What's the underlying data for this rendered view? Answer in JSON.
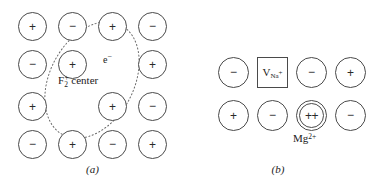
{
  "figure": {
    "panels": [
      {
        "id": "a",
        "caption": "(a)",
        "type": "F2-plus-center-lattice",
        "annotations": {
          "electron": "e",
          "electron_superscript": "−",
          "center_label_main": "F",
          "center_label_sub": "2",
          "center_label_sup": "+",
          "center_label_text": " center"
        },
        "grid": {
          "rows": 4,
          "cols": 4,
          "cells": [
            [
              {
                "kind": "ion",
                "sign": "+"
              },
              {
                "kind": "ion",
                "sign": "−"
              },
              {
                "kind": "ion",
                "sign": "+"
              },
              {
                "kind": "ion",
                "sign": "−"
              }
            ],
            [
              {
                "kind": "ion",
                "sign": "−"
              },
              {
                "kind": "ion",
                "sign": "+"
              },
              {
                "kind": "vacancy",
                "sign": ""
              },
              {
                "kind": "ion",
                "sign": "+"
              }
            ],
            [
              {
                "kind": "ion",
                "sign": "+"
              },
              {
                "kind": "vacancy",
                "sign": ""
              },
              {
                "kind": "ion",
                "sign": "+"
              },
              {
                "kind": "ion",
                "sign": "−"
              }
            ],
            [
              {
                "kind": "ion",
                "sign": "−"
              },
              {
                "kind": "ion",
                "sign": "+"
              },
              {
                "kind": "ion",
                "sign": "−"
              },
              {
                "kind": "ion",
                "sign": "+"
              }
            ]
          ]
        },
        "ellipse": {
          "style": "dotted",
          "color": "#6b6b6b",
          "cx": 92,
          "cy": 80,
          "rx": 62,
          "ry": 42,
          "rotation_deg": -62
        }
      },
      {
        "id": "b",
        "caption": "(b)",
        "type": "vacancy-and-divalent-substitution",
        "grid": {
          "rows": 2,
          "cols": 4,
          "cells": [
            [
              {
                "kind": "ion",
                "sign": "−"
              },
              {
                "kind": "vacancy-box",
                "label_main": "V",
                "label_sub": "Na",
                "label_sup": "+"
              },
              {
                "kind": "ion",
                "sign": "−"
              },
              {
                "kind": "ion",
                "sign": "+"
              }
            ],
            [
              {
                "kind": "ion",
                "sign": "+"
              },
              {
                "kind": "ion",
                "sign": "−"
              },
              {
                "kind": "ion-double",
                "sign": "++",
                "label_main": "Mg",
                "label_sup": "2+"
              },
              {
                "kind": "ion",
                "sign": "−"
              }
            ]
          ]
        }
      }
    ]
  },
  "colors": {
    "outline": "#4a4a4a",
    "dotted": "#6b6b6b",
    "text": "#1a1a1a",
    "background": "#ffffff"
  }
}
